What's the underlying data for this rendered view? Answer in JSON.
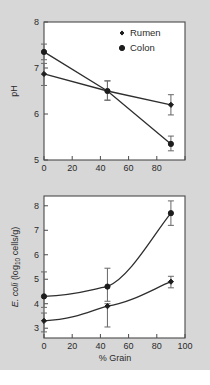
{
  "figure": {
    "background_color": "#d7d7d7",
    "plot_background_color": "#ffffff",
    "axis_color": "#4a4a4a",
    "marker_color": "#1d1d1d",
    "errorbar_color": "#6d6d6d"
  },
  "legend": {
    "position": "top-right",
    "entries": [
      {
        "label": "Rumen",
        "marker": "diamond-small-icon"
      },
      {
        "label": "Colon",
        "marker": "circle-filled-icon"
      }
    ]
  },
  "axes": {
    "x_ticks_top": [
      "0",
      "20",
      "40",
      "60",
      "80"
    ],
    "x_ticks_bottom": [
      "0",
      "20",
      "40",
      "60",
      "80",
      "100"
    ],
    "y_ticks_top": [
      "5",
      "6",
      "7",
      "8"
    ],
    "y_ticks_bottom": [
      "3",
      "4",
      "5",
      "6",
      "7",
      "8"
    ],
    "x_label": "% Grain",
    "y_label_top": "pH",
    "y_label_bottom_italic": "E. coli",
    "y_label_bottom_rest": " (log",
    "y_label_bottom_sub": "10",
    "y_label_bottom_tail": " cells/g)"
  },
  "chart_data": [
    {
      "type": "line",
      "panel": "top",
      "title": "",
      "xlabel": "% Grain",
      "ylabel": "pH",
      "xlim": [
        0,
        100
      ],
      "ylim": [
        5,
        8
      ],
      "xticks": [
        0,
        20,
        40,
        60,
        80,
        100
      ],
      "yticks": [
        5,
        6,
        7,
        8
      ],
      "grid": false,
      "legend_position": "top-right",
      "x": [
        0,
        45,
        90
      ],
      "series": [
        {
          "name": "Colon",
          "marker": "circle",
          "values": [
            7.35,
            6.5,
            5.35
          ],
          "err_low": [
            7.18,
            6.3,
            5.2
          ],
          "err_high": [
            7.52,
            6.72,
            5.52
          ]
        },
        {
          "name": "Rumen",
          "marker": "diamond",
          "values": [
            6.87,
            6.5,
            6.2
          ],
          "err_low": [
            6.62,
            6.3,
            5.98
          ],
          "err_high": [
            7.1,
            6.72,
            6.42
          ]
        }
      ]
    },
    {
      "type": "line",
      "panel": "bottom",
      "title": "",
      "xlabel": "% Grain",
      "ylabel": "E. coli (log10 cells/g)",
      "xlim": [
        0,
        100
      ],
      "ylim": [
        2.6,
        8.4
      ],
      "xticks": [
        0,
        20,
        40,
        60,
        80,
        100
      ],
      "yticks": [
        3,
        4,
        5,
        6,
        7,
        8
      ],
      "grid": false,
      "legend_position": "none",
      "x": [
        0,
        45,
        90
      ],
      "series": [
        {
          "name": "Colon",
          "marker": "circle",
          "values": [
            4.3,
            4.7,
            7.7
          ],
          "err_low": [
            3.85,
            4.1,
            7.2
          ],
          "err_high": [
            5.3,
            5.45,
            8.2
          ]
        },
        {
          "name": "Rumen",
          "marker": "diamond",
          "values": [
            3.3,
            3.9,
            4.9
          ],
          "err_low": [
            2.85,
            3.05,
            4.65
          ],
          "err_high": [
            3.62,
            4.0,
            5.12
          ]
        }
      ]
    }
  ]
}
